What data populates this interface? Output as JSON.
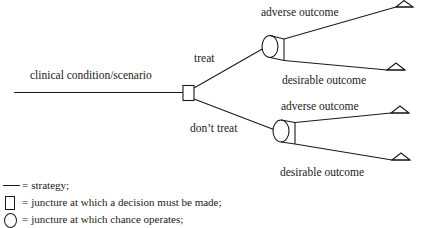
{
  "diagram": {
    "type": "decision-tree",
    "title_text": "clinical condition/scenario",
    "root_label": "clinical condition/scenario",
    "branches": [
      {
        "label": "treat",
        "outcomes": [
          "adverse outcome",
          "desirable outcome"
        ]
      },
      {
        "label": "don’t treat",
        "outcomes": [
          "adverse outcome",
          "desirable outcome"
        ]
      }
    ],
    "labels": {
      "treat": "treat",
      "dont_treat": "don’t treat",
      "adverse_top": "adverse outcome",
      "desirable_top": "desirable outcome",
      "adverse_bottom": "adverse outcome",
      "desirable_bottom": "desirable outcome"
    },
    "colors": {
      "stroke": "#1a1a1a",
      "background": "#ffffff",
      "text": "#1a1a1a"
    }
  },
  "legend": {
    "rows": [
      {
        "symbol": "line",
        "equals": "=",
        "text": "strategy;"
      },
      {
        "symbol": "square",
        "equals": "=",
        "text": "juncture at which a decision must be made;"
      },
      {
        "symbol": "circle",
        "equals": "=",
        "text": "juncture at which chance operates;"
      }
    ]
  }
}
